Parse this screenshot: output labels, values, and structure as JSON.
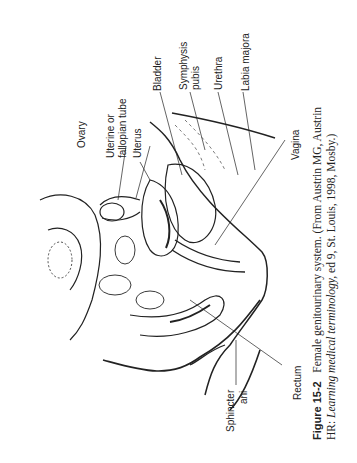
{
  "labels": {
    "ovary": "Ovary",
    "uterine_tube_1": "Uterine or",
    "uterine_tube_2": "fallopian tube",
    "uterus": "Uterus",
    "bladder": "Bladder",
    "symphysis_1": "Symphysis",
    "symphysis_2": "pubis",
    "urethra": "Urethra",
    "labia": "Labia majora",
    "vagina": "Vagina",
    "rectum": "Rectum",
    "sphincter_1": "Sphincter",
    "sphincter_2": "ani"
  },
  "caption": {
    "figure": "Figure 15-2",
    "line1_text": "Female genitourinary system. (From Austrin MG, Austrin",
    "line2_prefix": "HR: ",
    "line2_italic": "Learning medical terminology,",
    "line2_suffix": " ed 9, St. Louis, 1998, Mosby.)"
  }
}
